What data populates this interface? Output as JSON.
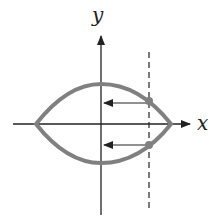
{
  "diagram": {
    "axes": {
      "x_label": "x",
      "y_label": "y"
    },
    "curve": {
      "description": "closed lens-shaped region symmetric about x-axis",
      "color": "#808080"
    },
    "dashed_line": {
      "description": "vertical dashed line intersecting curve"
    },
    "arrows": [
      {
        "direction": "left",
        "from": "upper intersection point",
        "to": "y-axis"
      },
      {
        "direction": "left",
        "from": "lower intersection point",
        "to": "y-axis"
      }
    ],
    "colors": {
      "axis": "#222222",
      "curve": "#808080"
    }
  }
}
